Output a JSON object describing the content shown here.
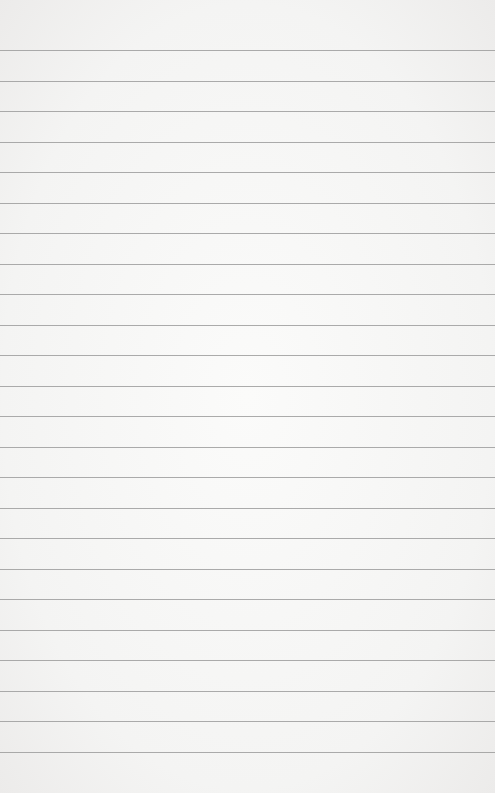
{
  "paper": {
    "type": "lined-paper",
    "background_color": "#f6f6f5",
    "line_color": "#9c9c9c",
    "line_count": 24,
    "first_line_y": 50,
    "line_spacing": 30.5
  }
}
